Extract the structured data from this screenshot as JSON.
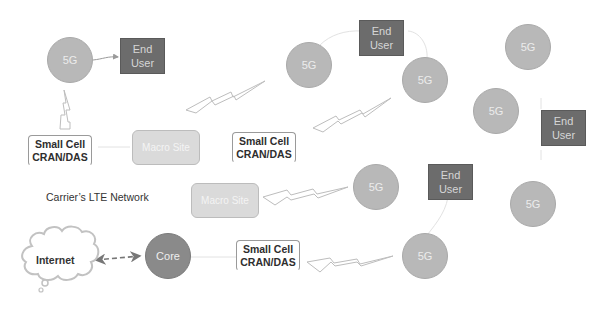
{
  "diagram": {
    "network_label": "Carrier’s LTE Network",
    "internet": {
      "label": "Internet",
      "icon": "cloud-icon"
    },
    "core": {
      "label": "Core"
    },
    "macro_sites": [
      {
        "label": "Macro Site"
      },
      {
        "label": "Macro Site"
      }
    ],
    "small_cells": [
      {
        "label": "Small Cell\nCRAN/DAS"
      },
      {
        "label": "Small Cell\nCRAN/DAS"
      },
      {
        "label": "Small Cell\nCRAN/DAS"
      }
    ],
    "nodes_5g": [
      {
        "label": "5G"
      },
      {
        "label": "5G"
      },
      {
        "label": "5G"
      },
      {
        "label": "5G"
      },
      {
        "label": "5G"
      },
      {
        "label": "5G"
      },
      {
        "label": "5G"
      },
      {
        "label": "5G"
      }
    ],
    "end_users": [
      {
        "label": "End\nUser"
      },
      {
        "label": "End\nUser"
      },
      {
        "label": "End\nUser"
      },
      {
        "label": "End\nUser"
      }
    ],
    "links": [
      {
        "from": "5G",
        "to": "End User",
        "type": "arrow"
      },
      {
        "from": "Internet",
        "to": "Core",
        "type": "dashed-bidirectional"
      },
      {
        "from": "Small Cell CRAN/DAS",
        "to": "5G",
        "type": "wireless"
      },
      {
        "from": "Macro Site",
        "to": "5G",
        "type": "wireless"
      },
      {
        "from": "Small Cell CRAN/DAS",
        "to": "5G",
        "type": "wireless"
      },
      {
        "from": "Macro Site",
        "to": "5G",
        "type": "wireless"
      },
      {
        "from": "Small Cell CRAN/DAS",
        "to": "5G",
        "type": "wireless"
      }
    ],
    "colors": {
      "node_5g": "#b8b8b8",
      "core": "#8a8a8a",
      "end_user": "#6c6c6c",
      "macro_site": "#dadada",
      "small_cell_border": "#9a9a9a",
      "connector": "#c8c8c8"
    }
  }
}
